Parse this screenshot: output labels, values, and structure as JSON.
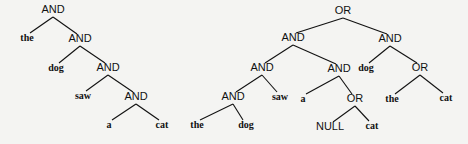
{
  "trees": [
    {
      "name": "left-and-tree",
      "nodes": [
        {
          "id": "l1",
          "label": "AND",
          "type": "op",
          "x": 53,
          "y": 13
        },
        {
          "id": "l2",
          "label": "the",
          "type": "word",
          "x": 27,
          "y": 41
        },
        {
          "id": "l3",
          "label": "AND",
          "type": "op",
          "x": 80,
          "y": 42
        },
        {
          "id": "l4",
          "label": "dog",
          "type": "word",
          "x": 56,
          "y": 71
        },
        {
          "id": "l5",
          "label": "AND",
          "type": "op",
          "x": 108,
          "y": 71
        },
        {
          "id": "l6",
          "label": "saw",
          "type": "word",
          "x": 83,
          "y": 99
        },
        {
          "id": "l7",
          "label": "AND",
          "type": "op",
          "x": 136,
          "y": 100
        },
        {
          "id": "l8",
          "label": "a",
          "type": "word",
          "x": 109,
          "y": 128
        },
        {
          "id": "l9",
          "label": "cat",
          "type": "word",
          "x": 162,
          "y": 128
        }
      ],
      "edges": [
        [
          "l1",
          "l2"
        ],
        [
          "l1",
          "l3"
        ],
        [
          "l3",
          "l4"
        ],
        [
          "l3",
          "l5"
        ],
        [
          "l5",
          "l6"
        ],
        [
          "l5",
          "l7"
        ],
        [
          "l7",
          "l8"
        ],
        [
          "l7",
          "l9"
        ]
      ]
    },
    {
      "name": "right-or-tree",
      "nodes": [
        {
          "id": "r1",
          "label": "OR",
          "type": "op",
          "x": 343,
          "y": 14
        },
        {
          "id": "r2",
          "label": "AND",
          "type": "op",
          "x": 293,
          "y": 41
        },
        {
          "id": "r3",
          "label": "AND",
          "type": "op",
          "x": 390,
          "y": 42
        },
        {
          "id": "r4",
          "label": "AND",
          "type": "op",
          "x": 262,
          "y": 71
        },
        {
          "id": "r5",
          "label": "AND",
          "type": "op",
          "x": 339,
          "y": 72
        },
        {
          "id": "r6",
          "label": "dog",
          "type": "word",
          "x": 366,
          "y": 71
        },
        {
          "id": "r7",
          "label": "OR",
          "type": "op",
          "x": 420,
          "y": 71
        },
        {
          "id": "r8",
          "label": "AND",
          "type": "op",
          "x": 233,
          "y": 100
        },
        {
          "id": "r9",
          "label": "saw",
          "type": "word",
          "x": 280,
          "y": 100
        },
        {
          "id": "r10",
          "label": "a",
          "type": "word",
          "x": 303,
          "y": 102
        },
        {
          "id": "r11",
          "label": "OR",
          "type": "op",
          "x": 355,
          "y": 102
        },
        {
          "id": "r12",
          "label": "the",
          "type": "word",
          "x": 392,
          "y": 102
        },
        {
          "id": "r13",
          "label": "cat",
          "type": "word",
          "x": 446,
          "y": 101
        },
        {
          "id": "r14",
          "label": "the",
          "type": "word",
          "x": 197,
          "y": 128
        },
        {
          "id": "r15",
          "label": "dog",
          "type": "word",
          "x": 246,
          "y": 128
        },
        {
          "id": "r16",
          "label": "NULL",
          "type": "op",
          "x": 330,
          "y": 130
        },
        {
          "id": "r17",
          "label": "cat",
          "type": "word",
          "x": 372,
          "y": 129
        }
      ],
      "edges": [
        [
          "r1",
          "r2"
        ],
        [
          "r1",
          "r3"
        ],
        [
          "r2",
          "r4"
        ],
        [
          "r2",
          "r5"
        ],
        [
          "r3",
          "r6"
        ],
        [
          "r3",
          "r7"
        ],
        [
          "r4",
          "r8"
        ],
        [
          "r4",
          "r9"
        ],
        [
          "r5",
          "r10"
        ],
        [
          "r5",
          "r11"
        ],
        [
          "r7",
          "r12"
        ],
        [
          "r7",
          "r13"
        ],
        [
          "r8",
          "r14"
        ],
        [
          "r8",
          "r15"
        ],
        [
          "r11",
          "r16"
        ],
        [
          "r11",
          "r17"
        ]
      ]
    }
  ]
}
